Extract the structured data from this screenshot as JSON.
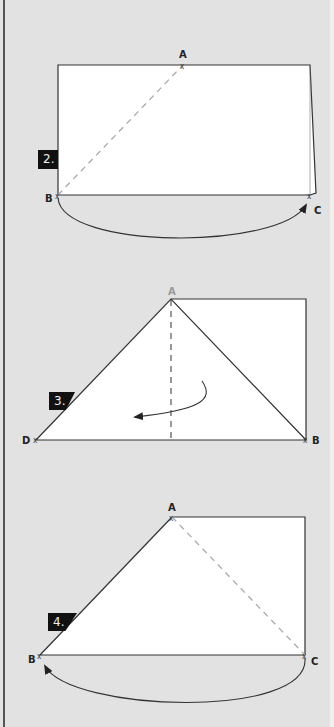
{
  "steps": [
    {
      "label": "2.",
      "points": {
        "A": "A",
        "B": "B",
        "C": "C"
      },
      "description": "Rectangle with dashed diagonal from B to A; curved arrow from B to C below"
    },
    {
      "label": "3.",
      "points": {
        "A": "A",
        "D": "D",
        "B": "B"
      },
      "description": "Triangle D-A-B with dashed vertical fold line from A; curved arrow folding left"
    },
    {
      "label": "4.",
      "points": {
        "A": "A",
        "B": "B",
        "C": "C"
      },
      "description": "Triangle B-A-C with dashed line from A to C; curved arrow from C back to B"
    }
  ],
  "colors": {
    "background": "#e2e2e2",
    "paper": "#ffffff",
    "line": "#333333",
    "dashed": "#aaaaaa",
    "label_bg": "#111111",
    "label_text": "#eeeeee"
  }
}
